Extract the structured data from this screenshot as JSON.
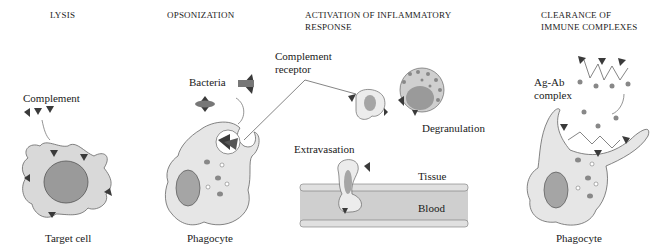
{
  "panels": [
    {
      "id": "lysis",
      "title": "LYSIS",
      "labels": {
        "complement": "Complement",
        "target": "Target cell"
      }
    },
    {
      "id": "opsonization",
      "title": "OPSONIZATION",
      "labels": {
        "bacteria": "Bacteria",
        "phagocyte": "Phagocyte"
      }
    },
    {
      "id": "inflammatory",
      "title_line1": "ACTIVATION OF INFLAMMATORY",
      "title_line2": "RESPONSE",
      "labels": {
        "receptor_line1": "Complement",
        "receptor_line2": "receptor",
        "degranulation": "Degranulation",
        "extravasation": "Extravasation",
        "tissue": "Tissue",
        "blood": "Blood"
      }
    },
    {
      "id": "clearance",
      "title_line1": "CLEARANCE OF",
      "title_line2": "IMMUNE COMPLEXES",
      "labels": {
        "agab_line1": "Ag-Ab",
        "agab_line2": "complex",
        "phagocyte": "Phagocyte"
      }
    }
  ],
  "colors": {
    "cell_fill": "#e6e6e6",
    "nucleus": "#9a9a9a",
    "complement": "#3a3a3a",
    "outline": "#555555",
    "blood": "#cfcfcf",
    "granule": "#8a8a8a"
  }
}
